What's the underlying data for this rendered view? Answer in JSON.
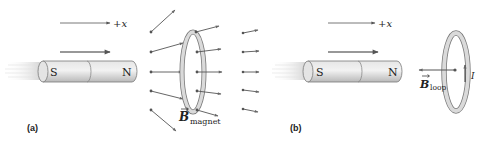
{
  "figure": {
    "panels": [
      {
        "id": "a",
        "label": "(a)",
        "axis_label": "+x",
        "magnet": {
          "south_label": "S",
          "north_label": "N",
          "motion": "toward loop (+x)"
        },
        "field_label": {
          "symbol": "B",
          "subscript": "magnet"
        },
        "description": "Bar magnet moving toward loop; magnet's field lines diverge through the loop"
      },
      {
        "id": "b",
        "label": "(b)",
        "axis_label": "+x",
        "magnet": {
          "south_label": "S",
          "north_label": "N",
          "motion": "toward loop (+x)"
        },
        "field_label": {
          "symbol": "B",
          "subscript": "loop"
        },
        "current_label": "I",
        "description": "Induced current I in loop creates field B_loop pointing in -x, opposing the approaching magnet"
      }
    ],
    "colors": {
      "arrow": "#555555",
      "magnet_fill": "#d9d9d9",
      "magnet_stroke": "#7a7a7a",
      "loop_fill": "#d4d4d4",
      "loop_stroke": "#7a7a7a",
      "text": "#222222"
    }
  }
}
